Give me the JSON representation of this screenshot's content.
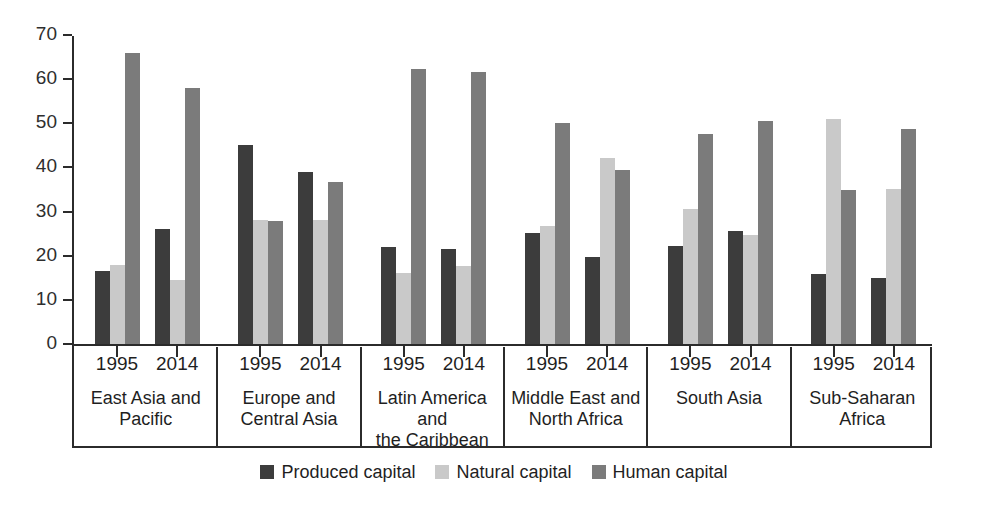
{
  "chart_data": {
    "type": "bar",
    "title": "",
    "subtitle": "",
    "xlabel": "",
    "ylabel": "",
    "ylim": [
      0,
      70
    ],
    "yticks": [
      0,
      10,
      20,
      30,
      40,
      50,
      60,
      70
    ],
    "grid": false,
    "legend_position": "bottom-center",
    "group_labels": [
      "East Asia and Pacific",
      "Europe and Central Asia",
      "Latin America and the Caribbean",
      "Middle East and North Africa",
      "South Asia",
      "Sub-Saharan Africa"
    ],
    "group_label_lines": [
      [
        "East Asia and",
        "Pacific"
      ],
      [
        "Europe and",
        "Central Asia"
      ],
      [
        "Latin America and",
        "the Caribbean"
      ],
      [
        "Middle East and",
        "North Africa"
      ],
      [
        "South Asia",
        ""
      ],
      [
        "Sub-Saharan",
        "Africa"
      ]
    ],
    "categories": [
      "1995",
      "2014"
    ],
    "series": [
      {
        "name": "Produced capital",
        "color": "#3c3c3c",
        "values_by_group": {
          "East Asia and Pacific": [
            16.5,
            26.0
          ],
          "Europe and Central Asia": [
            45.0,
            39.0
          ],
          "Latin America and the Caribbean": [
            22.0,
            21.5
          ],
          "Middle East and North Africa": [
            25.2,
            19.7
          ],
          "South Asia": [
            22.3,
            25.5
          ],
          "Sub-Saharan Africa": [
            15.8,
            15.0
          ]
        }
      },
      {
        "name": "Natural capital",
        "color": "#c9c9c9",
        "values_by_group": {
          "East Asia and Pacific": [
            18.0,
            14.5
          ],
          "Europe and Central Asia": [
            28.0,
            28.0
          ],
          "Latin America and the Caribbean": [
            16.0,
            17.6
          ],
          "Middle East and North Africa": [
            26.7,
            42.2
          ],
          "South Asia": [
            30.5,
            24.7
          ],
          "Sub-Saharan Africa": [
            51.0,
            35.2
          ]
        }
      },
      {
        "name": "Human capital",
        "color": "#7b7b7b",
        "values_by_group": {
          "East Asia and Pacific": [
            66.0,
            58.0
          ],
          "Europe and Central Asia": [
            27.8,
            36.7
          ],
          "Latin America and the Caribbean": [
            62.4,
            61.6
          ],
          "Middle East and North Africa": [
            50.0,
            39.5
          ],
          "South Asia": [
            47.5,
            50.5
          ],
          "Sub-Saharan Africa": [
            35.0,
            48.7
          ]
        }
      }
    ],
    "legend": [
      {
        "label": "Produced capital",
        "color": "#3c3c3c"
      },
      {
        "label": "Natural capital",
        "color": "#c9c9c9"
      },
      {
        "label": "Human capital",
        "color": "#7b7b7b"
      }
    ]
  }
}
